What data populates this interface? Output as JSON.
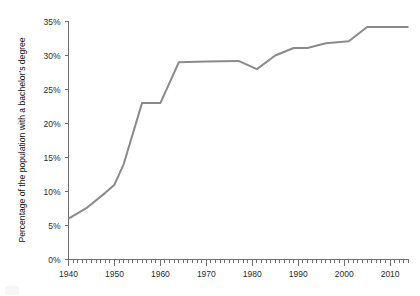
{
  "chart_data": {
    "type": "line",
    "title": "",
    "subtitle": "",
    "xlabel": "",
    "ylabel": "Percentage of the population with a bachelor's degree",
    "xlim": [
      1940,
      2014
    ],
    "ylim": [
      0,
      35
    ],
    "grid": false,
    "legend": false,
    "legend_position": "none",
    "x_tick_labels": [
      "1940",
      "1950",
      "1960",
      "1970",
      "1980",
      "1990",
      "2000",
      "2010"
    ],
    "x_tick_values": [
      1940,
      1950,
      1960,
      1970,
      1980,
      1990,
      2000,
      2010
    ],
    "x_minor_tick_interval": 1,
    "y_tick_labels": [
      "0%",
      "5%",
      "10%",
      "15%",
      "20%",
      "25%",
      "30%",
      "35%"
    ],
    "y_tick_values": [
      0,
      5,
      10,
      15,
      20,
      25,
      30,
      35
    ],
    "series": [
      {
        "name": "Percentage with a bachelor's degree",
        "color": "#8a8a8a",
        "x": [
          1940,
          1944,
          1948,
          1950,
          1952,
          1956,
          1960,
          1964,
          1970,
          1977,
          1981,
          1985,
          1989,
          1992,
          1996,
          2001,
          2005,
          2009,
          2014
        ],
        "values": [
          6.0,
          7.6,
          9.8,
          11.0,
          14.0,
          23.0,
          23.0,
          29.0,
          29.1,
          29.2,
          28.0,
          30.0,
          31.1,
          31.1,
          31.8,
          32.1,
          34.2,
          34.2,
          34.2
        ]
      }
    ]
  },
  "annotations": {
    "start_value_label": "6%",
    "plateau_1956_1960_label": "23%",
    "plateau_1964_1977_label": "29%",
    "dip_1981_label": "28%",
    "final_plateau_label": "34%"
  }
}
